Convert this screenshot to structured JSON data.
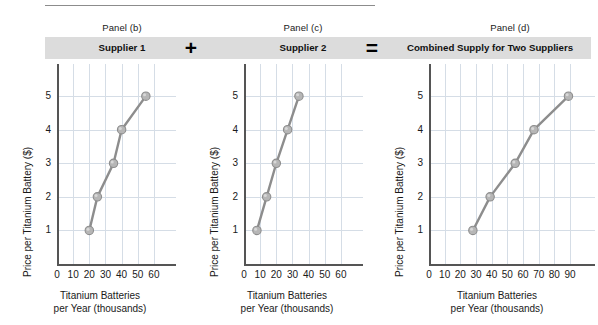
{
  "figure": {
    "panels": [
      {
        "caption": "Panel (b)",
        "banner_label": "Supplier 1",
        "operator_after": "+",
        "operator_name": "plus-symbol"
      },
      {
        "caption": "Panel (c)",
        "banner_label": "Supplier 2",
        "operator_after": "=",
        "operator_name": "equals-symbol"
      },
      {
        "caption": "Panel (d)",
        "banner_label": "Combined Supply for Two Suppliers",
        "operator_after": "",
        "operator_name": ""
      }
    ],
    "axis_titles": {
      "y": "Price per Titanium Battery ($)",
      "x_line1": "Titanium Batteries",
      "x_line2": "per Year (thousands)"
    },
    "colors": {
      "banner_background": "#dcdcdc",
      "series_line": "#8d8d8d",
      "marker_fill": "#b6b6b6",
      "gridline": "#d5dde6",
      "axis": "#555555",
      "text": "#1a1a1a"
    }
  },
  "chart_data": [
    {
      "type": "line",
      "title": "Supplier 1",
      "subtitle": "Panel (b)",
      "xlabel": "Titanium Batteries per Year (thousands)",
      "ylabel": "Price per Titanium Battery ($)",
      "xlim": [
        0,
        65
      ],
      "ylim": [
        0,
        5.6
      ],
      "xticks": [
        0,
        10,
        20,
        30,
        40,
        50,
        60
      ],
      "yticks": [
        1,
        2,
        3,
        4,
        5
      ],
      "grid": true,
      "legend": "none",
      "x": [
        20,
        25,
        35,
        40,
        55
      ],
      "y": [
        1,
        2,
        3,
        4,
        5
      ],
      "markers": "circle"
    },
    {
      "type": "line",
      "title": "Supplier 2",
      "subtitle": "Panel (c)",
      "xlabel": "Titanium Batteries per Year (thousands)",
      "ylabel": "Price per Titanium Battery ($)",
      "xlim": [
        0,
        65
      ],
      "ylim": [
        0,
        5.6
      ],
      "xticks": [
        0,
        10,
        20,
        30,
        40,
        50,
        60
      ],
      "yticks": [
        1,
        2,
        3,
        4,
        5
      ],
      "grid": true,
      "legend": "none",
      "x": [
        8,
        14,
        20,
        27,
        34
      ],
      "y": [
        1,
        2,
        3,
        4,
        5
      ],
      "markers": "circle"
    },
    {
      "type": "line",
      "title": "Combined Supply for Two Suppliers",
      "subtitle": "Panel (d)",
      "xlabel": "Titanium Batteries per Year (thousands)",
      "ylabel": "Price per Titanium Battery ($)",
      "xlim": [
        0,
        97
      ],
      "ylim": [
        0,
        5.6
      ],
      "xticks": [
        0,
        10,
        20,
        30,
        40,
        50,
        60,
        70,
        80,
        90
      ],
      "yticks": [
        1,
        2,
        3,
        4,
        5
      ],
      "grid": true,
      "legend": "none",
      "x": [
        28,
        39,
        55,
        67,
        89
      ],
      "y": [
        1,
        2,
        3,
        4,
        5
      ],
      "markers": "circle"
    }
  ]
}
